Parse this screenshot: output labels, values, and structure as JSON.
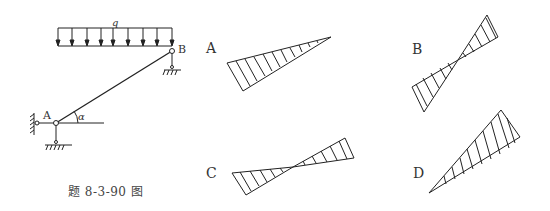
{
  "figure": {
    "caption": "题 8-3-90 图",
    "load_label": "q",
    "node_a_label": "A",
    "node_b_label": "B",
    "angle_label": "α"
  },
  "options": [
    {
      "label": "A",
      "description": "single triangle, max at lower-left end, zero at upper-right"
    },
    {
      "label": "B",
      "description": "two triangles crossing at midpoint, steep orientation"
    },
    {
      "label": "C",
      "description": "two triangles crossing at midpoint, shallow orientation"
    },
    {
      "label": "D",
      "description": "single triangle, zero at lower-left end, max at upper-right"
    }
  ],
  "colors": {
    "stroke": "#222222",
    "text": "#333333",
    "background": "#ffffff"
  }
}
